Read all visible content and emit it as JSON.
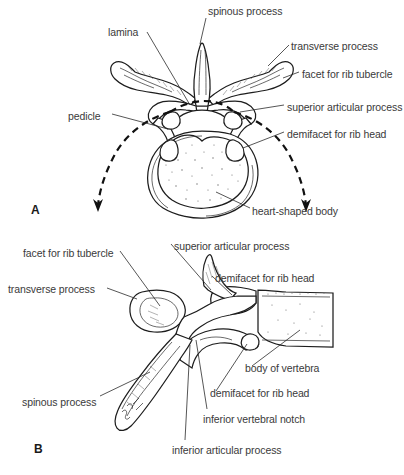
{
  "figure": {
    "background_color": "#ffffff",
    "text_color": "#3a3a3a",
    "line_color": "#1d1d1d"
  },
  "panel_a": {
    "letter": "A",
    "view": "superior view of a thoracic vertebra",
    "labels": [
      {
        "id": "spinous-process",
        "text": "spinous process",
        "x": 208,
        "y": 5,
        "align": "left"
      },
      {
        "id": "lamina",
        "text": "lamina",
        "x": 108,
        "y": 26,
        "align": "left"
      },
      {
        "id": "transverse-process",
        "text": "transverse process",
        "x": 291,
        "y": 40,
        "align": "left"
      },
      {
        "id": "facet-for-rib-tubercle",
        "text": "facet for rib tubercle",
        "x": 302,
        "y": 68,
        "align": "left"
      },
      {
        "id": "superior-articular-process",
        "text": "superior articular process",
        "x": 287,
        "y": 101,
        "align": "left"
      },
      {
        "id": "demifacet-for-rib-head",
        "text": "demifacet for rib head",
        "x": 287,
        "y": 128,
        "align": "left"
      },
      {
        "id": "pedicle",
        "text": "pedicle",
        "x": 68,
        "y": 110,
        "align": "left"
      },
      {
        "id": "heart-shaped-body",
        "text": "heart-shaped body",
        "x": 252,
        "y": 205,
        "align": "left"
      }
    ]
  },
  "panel_b": {
    "letter": "B",
    "view": "lateral view of a thoracic vertebra",
    "labels": [
      {
        "id": "facet-for-rib-tubercle",
        "text": "facet for rib tubercle",
        "x": 23,
        "y": 247,
        "align": "left"
      },
      {
        "id": "superior-articular-process",
        "text": "superior articular process",
        "x": 174,
        "y": 240,
        "align": "left"
      },
      {
        "id": "demifacet-for-rib-head-top",
        "text": "demifacet for rib head",
        "x": 215,
        "y": 272,
        "align": "left"
      },
      {
        "id": "transverse-process",
        "text": "transverse process",
        "x": 8,
        "y": 283,
        "align": "left"
      },
      {
        "id": "body-of-vertebra",
        "text": "body of vertebra",
        "x": 245,
        "y": 362,
        "align": "left"
      },
      {
        "id": "demifacet-for-rib-head-low",
        "text": "demifacet for rib head",
        "x": 210,
        "y": 387,
        "align": "left"
      },
      {
        "id": "spinous-process",
        "text": "spinous process",
        "x": 22,
        "y": 396,
        "align": "left"
      },
      {
        "id": "inferior-vertebral-notch",
        "text": "inferior vertebral notch",
        "x": 203,
        "y": 413,
        "align": "left"
      },
      {
        "id": "inferior-articular-process",
        "text": "inferior articular process",
        "x": 172,
        "y": 444,
        "align": "left"
      }
    ]
  }
}
